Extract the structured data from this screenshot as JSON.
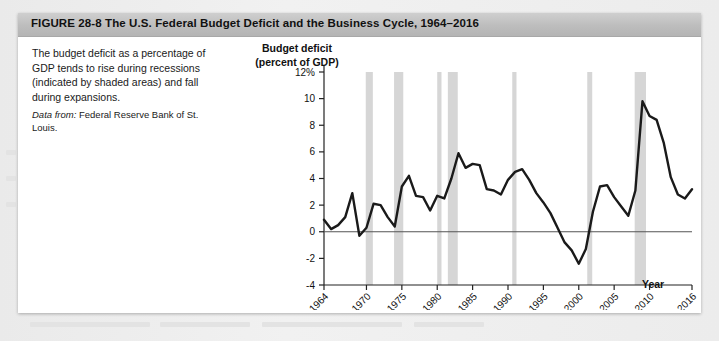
{
  "figure": {
    "title": "FIGURE 28-8  The U.S. Federal Budget Deficit and the Business Cycle, 1964–2016",
    "caption": "The budget deficit as a percentage of GDP tends to rise during recessions (indicated by shaded areas) and fall during expansions.",
    "source_label": "Data from:",
    "source_text": " Federal Reserve Bank of St. Louis."
  },
  "chart_data": {
    "type": "line",
    "title": "The U.S. Federal Budget Deficit and the Business Cycle, 1964–2016",
    "xlabel": "Year",
    "ylabel": "Budget deficit (percent of GDP)",
    "ylabel_line1": "Budget deficit",
    "ylabel_line2": "(percent of GDP)",
    "xlim": [
      1964,
      2016
    ],
    "ylim": [
      -4,
      12
    ],
    "grid": false,
    "legend": null,
    "zero_line": 0,
    "y_ticks": [
      12,
      10,
      8,
      6,
      4,
      2,
      0,
      -2,
      -4
    ],
    "y_tick_labels": [
      "12%",
      "10",
      "8",
      "6",
      "4",
      "2",
      "0",
      "-2",
      "-4"
    ],
    "x_ticks": [
      1964,
      1970,
      1975,
      1980,
      1985,
      1990,
      1995,
      2000,
      2005,
      2010,
      2016
    ],
    "x_tick_labels": [
      "1964",
      "1970",
      "1975",
      "1980",
      "1985",
      "1990",
      "1995",
      "2000",
      "2005",
      "2010",
      "2016"
    ],
    "series": [
      {
        "name": "Federal budget deficit (percent of GDP)",
        "color": "#1a1a1a",
        "x": [
          1964,
          1965,
          1966,
          1967,
          1968,
          1969,
          1970,
          1971,
          1972,
          1973,
          1974,
          1975,
          1976,
          1977,
          1978,
          1979,
          1980,
          1981,
          1982,
          1983,
          1984,
          1985,
          1986,
          1987,
          1988,
          1989,
          1990,
          1991,
          1992,
          1993,
          1994,
          1995,
          1996,
          1997,
          1998,
          1999,
          2000,
          2001,
          2002,
          2003,
          2004,
          2005,
          2006,
          2007,
          2008,
          2009,
          2010,
          2011,
          2012,
          2013,
          2014,
          2015,
          2016
        ],
        "y": [
          0.9,
          0.2,
          0.5,
          1.1,
          2.9,
          -0.3,
          0.3,
          2.1,
          2.0,
          1.1,
          0.4,
          3.4,
          4.2,
          2.7,
          2.6,
          1.6,
          2.7,
          2.5,
          4.0,
          5.9,
          4.8,
          5.1,
          5.0,
          3.2,
          3.1,
          2.8,
          3.9,
          4.5,
          4.7,
          3.9,
          2.9,
          2.2,
          1.4,
          0.3,
          -0.8,
          -1.4,
          -2.4,
          -1.3,
          1.5,
          3.4,
          3.5,
          2.6,
          1.9,
          1.2,
          3.1,
          9.8,
          8.7,
          8.4,
          6.7,
          4.1,
          2.8,
          2.5,
          3.2
        ],
        "peak_value": 9.8,
        "peak_year": 2009,
        "min_value": -2.4,
        "min_year": 2000
      }
    ],
    "recession_bands": [
      {
        "start": 1969.9,
        "end": 1970.9
      },
      {
        "start": 1973.9,
        "end": 1975.2
      },
      {
        "start": 1980.0,
        "end": 1980.6
      },
      {
        "start": 1981.5,
        "end": 1982.9
      },
      {
        "start": 1990.6,
        "end": 1991.2
      },
      {
        "start": 2001.2,
        "end": 2001.9
      },
      {
        "start": 2007.9,
        "end": 2009.5
      }
    ],
    "recession_band_color": "#d6d6d6"
  }
}
